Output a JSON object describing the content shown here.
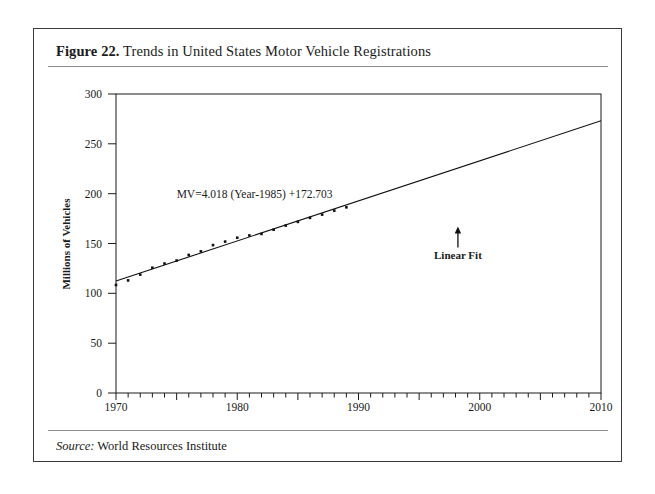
{
  "figure": {
    "number_label": "Figure 22.",
    "title": " Trends in United States Motor Vehicle Registrations",
    "source_label": "Source:",
    "source_text": " World Resources Institute"
  },
  "chart_data": {
    "type": "scatter",
    "title": "Trends in United States Motor Vehicle Registrations",
    "xlabel": "",
    "ylabel": "Millions of Vehicles",
    "xlim": [
      1970,
      2010
    ],
    "ylim": [
      0,
      300
    ],
    "grid": false,
    "legend_position": "none",
    "y_ticks": [
      0,
      50,
      100,
      150,
      200,
      250,
      300
    ],
    "x_ticks": [
      1970,
      1980,
      1990,
      2000,
      2010
    ],
    "x_minor_tick_step": 1,
    "x_major_tick_step": 5,
    "annotations": [
      {
        "name": "regression-equation",
        "text": "MV=4.018 (Year-1985) +172.703",
        "x": 1975.0,
        "y": 196
      },
      {
        "name": "linear-fit-label",
        "text": "Linear Fit",
        "x": 1998.2,
        "y": 152,
        "arrow": "up"
      }
    ],
    "series": [
      {
        "name": "Motor Vehicle Registrations",
        "type": "scatter",
        "marker": "square",
        "color": "#111111",
        "x": [
          1970,
          1971,
          1972,
          1973,
          1974,
          1975,
          1976,
          1977,
          1978,
          1979,
          1980,
          1981,
          1982,
          1983,
          1984,
          1985,
          1986,
          1987,
          1988,
          1989
        ],
        "values": [
          108.4,
          113.0,
          118.8,
          125.7,
          129.9,
          132.9,
          138.5,
          142.1,
          148.4,
          151.9,
          155.8,
          158.1,
          159.6,
          163.8,
          168.0,
          171.7,
          175.7,
          179.0,
          183.0,
          186.3
        ]
      },
      {
        "name": "Linear Fit",
        "type": "line",
        "color": "#111111",
        "equation": "MV=4.018 (Year-1985) +172.703",
        "slope": 4.018,
        "intercept": 172.703,
        "center_year": 1985,
        "x": [
          1970,
          2010
        ],
        "values": [
          112.4,
          273.1
        ]
      }
    ]
  }
}
